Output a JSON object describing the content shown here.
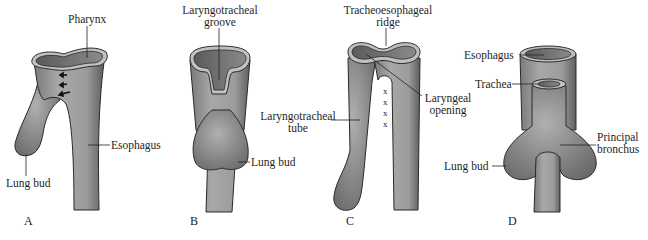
{
  "figure": {
    "panels": [
      {
        "letter": "A",
        "labels": {
          "pharynx": "Pharynx",
          "esophagus": "Esophagus",
          "lung_bud": "Lung bud"
        }
      },
      {
        "letter": "B",
        "labels": {
          "groove_line1": "Laryngotracheal",
          "groove_line2": "groove",
          "lung_bud": "Lung bud"
        }
      },
      {
        "letter": "C",
        "labels": {
          "ridge_line1": "Tracheoesophageal",
          "ridge_line2": "ridge",
          "tube_line1": "Laryngotracheal",
          "tube_line2": "tube",
          "opening_line1": "Laryngeal",
          "opening_line2": "opening",
          "x_marks": [
            "x",
            "x",
            "x",
            "x"
          ]
        }
      },
      {
        "letter": "D",
        "labels": {
          "esophagus": "Esophagus",
          "trachea": "Trachea",
          "lung_bud": "Lung bud",
          "bronchus_line1": "Principal",
          "bronchus_line2": "bronchus"
        }
      }
    ],
    "colors": {
      "tissue": "#9a9a9a",
      "tissue_dark": "#6e6e6e",
      "outline": "#2a2a2a",
      "background": "#ffffff"
    }
  }
}
